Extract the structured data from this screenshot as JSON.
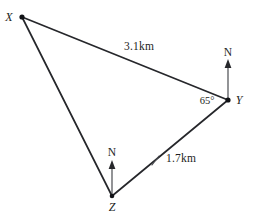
{
  "diagram": {
    "type": "bearing-triangle",
    "background_color": "#ffffff",
    "line_color": "#26272b",
    "vertices": [
      {
        "id": "X",
        "label": "X",
        "x": 22,
        "y": 17
      },
      {
        "id": "Y",
        "label": "Y",
        "x": 228,
        "y": 100
      },
      {
        "id": "Z",
        "label": "Z",
        "x": 112,
        "y": 196
      }
    ],
    "edges": [
      {
        "id": "XY",
        "from": "X",
        "to": "Y",
        "label": "3.1km"
      },
      {
        "id": "ZY",
        "from": "Z",
        "to": "Y",
        "label": "1.7km"
      },
      {
        "id": "XZ",
        "from": "X",
        "to": "Z",
        "label": ""
      }
    ],
    "labels": {
      "vertex_x": "X",
      "vertex_y": "Y",
      "vertex_z": "Z",
      "distance_xy": "3.1km",
      "distance_zy": "1.7km",
      "angle_at_y": "65°",
      "north_at_y": "N",
      "north_at_z": "N"
    },
    "measurements": {
      "side_xy_km": 3.1,
      "side_zy_km": 1.7,
      "angle_y_degrees": 65
    },
    "north_arrows": [
      {
        "at": "Y",
        "label": "N",
        "direction": "up"
      },
      {
        "at": "Z",
        "label": "N",
        "direction": "up"
      }
    ]
  }
}
